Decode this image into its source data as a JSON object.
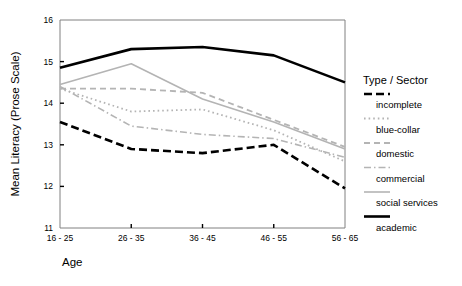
{
  "chart_data": {
    "type": "line",
    "title": "",
    "xlabel": "Age",
    "ylabel": "Mean Literacy (Prose Scale)",
    "categories": [
      "16 - 25",
      "26 - 35",
      "36 - 45",
      "46 - 55",
      "56 - 65"
    ],
    "ylim": [
      11,
      16
    ],
    "yticks": [
      11,
      12,
      13,
      14,
      15,
      16
    ],
    "ytick_labels": [
      "11",
      "12",
      "13",
      "14",
      "15",
      "16"
    ],
    "grid": false,
    "legend_position": "right",
    "legend_title": "Type / Sector",
    "series": [
      {
        "name": "incomplete",
        "style": "thick-dashed",
        "color": "#000000",
        "values": [
          13.55,
          12.9,
          12.8,
          13.0,
          11.95
        ]
      },
      {
        "name": "blue-collar",
        "style": "dotted",
        "color": "#b4b4b4",
        "values": [
          14.35,
          13.8,
          13.85,
          13.35,
          12.6
        ]
      },
      {
        "name": "domestic",
        "style": "dash-dot",
        "color": "#b4b4b4",
        "values": [
          14.4,
          13.45,
          13.25,
          13.15,
          12.7
        ]
      },
      {
        "name": "commercial",
        "style": "dashed",
        "color": "#b4b4b4",
        "values": [
          14.35,
          14.35,
          14.25,
          13.6,
          12.95
        ]
      },
      {
        "name": "social services",
        "style": "solid",
        "color": "#b4b4b4",
        "values": [
          14.45,
          14.95,
          14.1,
          13.55,
          12.9
        ]
      },
      {
        "name": "academic",
        "style": "thick-solid",
        "color": "#000000",
        "values": [
          14.85,
          15.3,
          15.35,
          15.15,
          14.5
        ]
      }
    ]
  },
  "legend": {
    "title": "Type / Sector",
    "entries": [
      {
        "label": "incomplete",
        "style": "thick-dashed",
        "color": "#000000"
      },
      {
        "label": "blue-collar",
        "style": "dotted",
        "color": "#b4b4b4"
      },
      {
        "label": "domestic",
        "style": "dashed",
        "color": "#b4b4b4"
      },
      {
        "label": "commercial",
        "style": "dash-dot",
        "color": "#b4b4b4"
      },
      {
        "label": "social services",
        "style": "solid",
        "color": "#b4b4b4"
      },
      {
        "label": "academic",
        "style": "thick-solid",
        "color": "#000000"
      }
    ]
  },
  "axes": {
    "y_title": "Mean Literacy (Prose Scale)",
    "x_title": "Age"
  },
  "colors": {
    "frame": "#808080",
    "dark_series": "#000000",
    "light_series": "#b4b4b4",
    "background": "#ffffff"
  }
}
